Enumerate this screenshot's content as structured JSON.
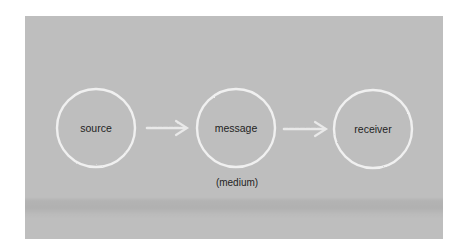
{
  "diagram": {
    "type": "flow",
    "background_color": "#bebebe",
    "stroke_color": "#f4f4f4",
    "nodes": [
      {
        "id": "source",
        "label": "source",
        "cx": 96,
        "cy": 128,
        "r": 39
      },
      {
        "id": "message",
        "label": "message",
        "sublabel": "(medium)",
        "cx": 236,
        "cy": 128,
        "r": 39
      },
      {
        "id": "receiver",
        "label": "receiver",
        "cx": 373,
        "cy": 129,
        "r": 39
      }
    ],
    "edges": [
      {
        "from": "source",
        "to": "message"
      },
      {
        "from": "message",
        "to": "receiver"
      }
    ]
  }
}
